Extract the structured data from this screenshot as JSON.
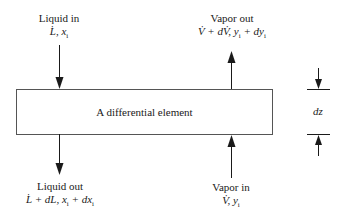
{
  "diagram": {
    "element": {
      "label": "A differential element"
    },
    "liquid_in": {
      "title": "Liquid in",
      "vars": "L̇, x_i",
      "display": "L, x"
    },
    "vapor_out": {
      "title": "Vapor out",
      "display": "V + dV, y + dy"
    },
    "liquid_out": {
      "title": "Liquid out",
      "display": "L + dL, x + dx"
    },
    "vapor_in": {
      "title": "Vapor in",
      "display": "V, y"
    },
    "height": {
      "label": "dz"
    },
    "colors": {
      "stroke": "#1a1a1a",
      "box_stroke": "#555555",
      "background": "#ffffff"
    }
  }
}
